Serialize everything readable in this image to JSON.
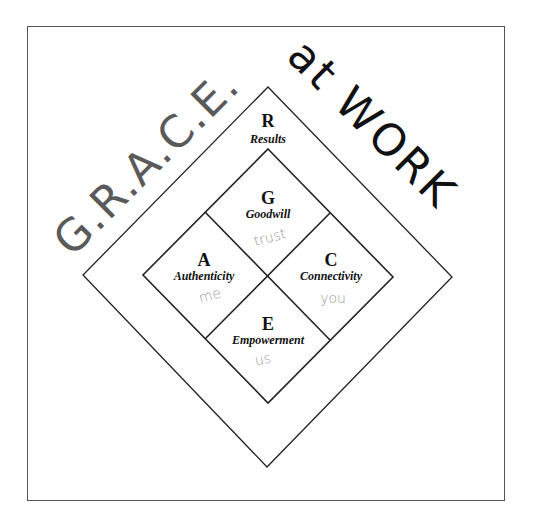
{
  "title": {
    "acronym": "G.R.A.C.E.",
    "suffix": "at WORK"
  },
  "outer": {
    "letter": "R",
    "label": "Results"
  },
  "quadrants": [
    {
      "position": "top",
      "letter": "G",
      "label": "Goodwill",
      "note": "trust"
    },
    {
      "position": "left",
      "letter": "A",
      "label": "Authenticity",
      "note": "me"
    },
    {
      "position": "right",
      "letter": "C",
      "label": "Connectivity",
      "note": "you"
    },
    {
      "position": "bottom",
      "letter": "E",
      "label": "Empowerment",
      "note": "us"
    }
  ],
  "colors": {
    "acronym": "#5a5a5a",
    "suffix": "#111111",
    "lines": "#222222",
    "handwriting": "#9a9a9a"
  }
}
